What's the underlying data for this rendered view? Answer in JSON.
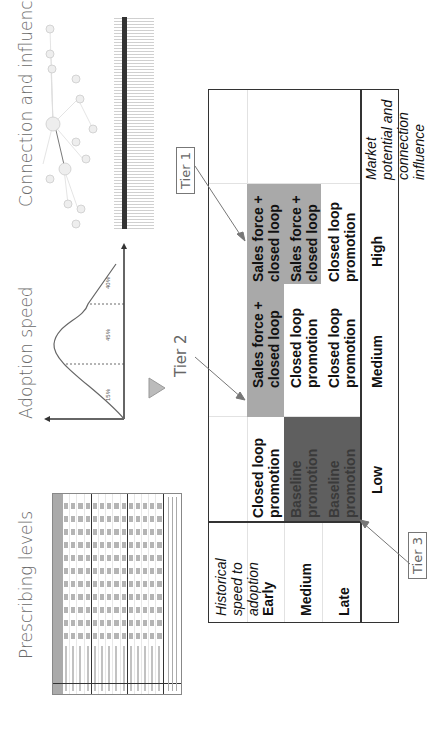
{
  "sections": {
    "prescribing": {
      "title": "Prescribing levels"
    },
    "adoption": {
      "title": "Adoption speed",
      "segments": [
        "15%",
        "45%",
        "40%"
      ],
      "colors": {
        "curve": "#666666",
        "axis": "#333333"
      }
    },
    "connection": {
      "title": "Connection and influence"
    }
  },
  "matrix": {
    "y_axis_title": "Historical speed to adoption",
    "x_axis_title": "Market potential and connection influence",
    "rows": [
      "Early",
      "Medium",
      "Late"
    ],
    "columns": [
      "Low",
      "Medium",
      "High"
    ],
    "cells": [
      [
        "Closed loop promotion",
        "Sales force + closed loop",
        "Sales force + closed loop"
      ],
      [
        "Baseline promotion",
        "Closed loop promotion",
        "Sales force + closed loop"
      ],
      [
        "Baseline promotion",
        "Closed loop promotion",
        "Closed loop promotion"
      ]
    ],
    "colors": {
      "tier1": "#a9a9a9",
      "tier3": "#5f5f5f",
      "line": "#333333",
      "grid": "#e2e2e2"
    }
  },
  "tiers": {
    "tier1": "Tier 1",
    "tier2": "Tier 2",
    "tier3": "Tier 3"
  }
}
